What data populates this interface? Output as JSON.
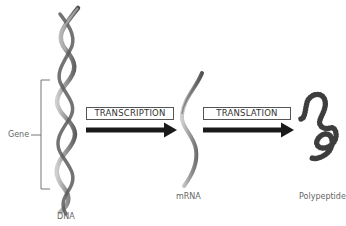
{
  "diagram": {
    "title": "",
    "stages": [
      {
        "id": "dna",
        "label": "DNA"
      },
      {
        "id": "mrna",
        "label": "mRNA"
      },
      {
        "id": "polypeptide",
        "label": "Polypeptide"
      }
    ],
    "processes": [
      {
        "id": "transcription",
        "label": "TRANSCRIPTION",
        "from": "dna",
        "to": "mrna"
      },
      {
        "id": "translation",
        "label": "TRANSLATION",
        "from": "mrna",
        "to": "polypeptide"
      }
    ],
    "annotations": {
      "gene_bracket_label": "Gene"
    },
    "colors": {
      "helix": "#8a8a8a",
      "helix_dark": "#555555",
      "arrow": "#1a1a1a",
      "polypeptide": "#444444",
      "box_border": "#555555",
      "text": "#666666"
    }
  }
}
